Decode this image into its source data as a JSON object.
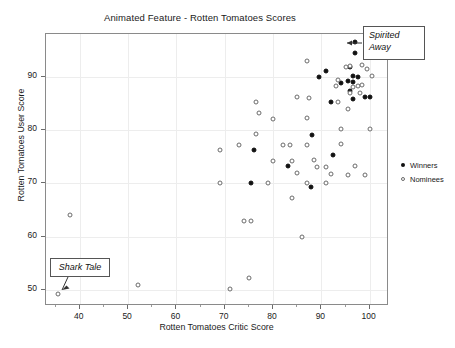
{
  "chart_data": {
    "type": "scatter",
    "title": "Animated Feature - Rotten Tomatoes Scores",
    "xlabel": "Rotten Tomatoes Critic Score",
    "ylabel": "Rotten Tomatoes User Score",
    "xlim": [
      33,
      104
    ],
    "ylim": [
      47,
      98
    ],
    "xticks": [
      40,
      50,
      60,
      70,
      80,
      90,
      100
    ],
    "yticks": [
      50,
      60,
      70,
      80,
      90
    ],
    "grid": true,
    "legend_position": "right",
    "legend": [
      {
        "label": "Winners",
        "marker": "filled-circle",
        "color": "#111111"
      },
      {
        "label": "Nominees",
        "marker": "open-circle",
        "color": "#6b6b6b"
      }
    ],
    "annotations": [
      {
        "label": "Spirited Away",
        "target_x": 97,
        "target_y": 96.5
      },
      {
        "label": "Shark Tale",
        "target_x": 36,
        "target_y": 50.2
      }
    ],
    "series": [
      {
        "name": "Winners",
        "marker": "filled-circle",
        "points": [
          [
            97,
            96.5
          ],
          [
            97,
            94.5
          ],
          [
            96,
            91.8
          ],
          [
            91,
            91.0
          ],
          [
            89.5,
            90.0
          ],
          [
            96.5,
            90.2
          ],
          [
            97.5,
            90.0
          ],
          [
            95.5,
            89.2
          ],
          [
            96.5,
            89.0
          ],
          [
            96,
            87.3
          ],
          [
            100,
            86.2
          ],
          [
            92,
            85.2
          ],
          [
            88,
            79.0
          ],
          [
            96.5,
            85.9
          ],
          [
            99,
            86.1
          ],
          [
            92.5,
            75.3
          ],
          [
            76,
            76.3
          ],
          [
            83,
            73.2
          ],
          [
            75.5,
            70.0
          ],
          [
            87.8,
            69.3
          ],
          [
            94,
            88.9
          ]
        ]
      },
      {
        "name": "Nominees",
        "marker": "open-circle",
        "points": [
          [
            87,
            93.0
          ],
          [
            96,
            92.0
          ],
          [
            98.5,
            92.1
          ],
          [
            95,
            91.8
          ],
          [
            99.5,
            91.5
          ],
          [
            100.5,
            90.1
          ],
          [
            93.5,
            89.3
          ],
          [
            93,
            88.3
          ],
          [
            96.5,
            88.0
          ],
          [
            97.5,
            88.2
          ],
          [
            98.5,
            88.5
          ],
          [
            96,
            87.0
          ],
          [
            98,
            87.0
          ],
          [
            85,
            86.1
          ],
          [
            87.5,
            86.0
          ],
          [
            93.5,
            85.2
          ],
          [
            76.5,
            85.2
          ],
          [
            77,
            83.2
          ],
          [
            95.5,
            84.0
          ],
          [
            80,
            82.0
          ],
          [
            87,
            82.2
          ],
          [
            76.5,
            79.2
          ],
          [
            94,
            80.1
          ],
          [
            100,
            80.1
          ],
          [
            73,
            77.2
          ],
          [
            82,
            77.2
          ],
          [
            83.5,
            77.1
          ],
          [
            87,
            77.1
          ],
          [
            94,
            77.3
          ],
          [
            69,
            76.3
          ],
          [
            80,
            74.2
          ],
          [
            84,
            74.1
          ],
          [
            88.5,
            74.3
          ],
          [
            89,
            73.1
          ],
          [
            91,
            73.0
          ],
          [
            85,
            71.9
          ],
          [
            97,
            73.3
          ],
          [
            99,
            71.5
          ],
          [
            92,
            71.8
          ],
          [
            95.5,
            71.5
          ],
          [
            69,
            70.0
          ],
          [
            79,
            70.0
          ],
          [
            87,
            70.1
          ],
          [
            91,
            70.1
          ],
          [
            84,
            67.2
          ],
          [
            74,
            63.0
          ],
          [
            75.5,
            63.0
          ],
          [
            38,
            64.0
          ],
          [
            86,
            60.0
          ],
          [
            52,
            51.0
          ],
          [
            75,
            52.2
          ],
          [
            71,
            50.1
          ],
          [
            35.5,
            49.3
          ]
        ]
      }
    ]
  }
}
